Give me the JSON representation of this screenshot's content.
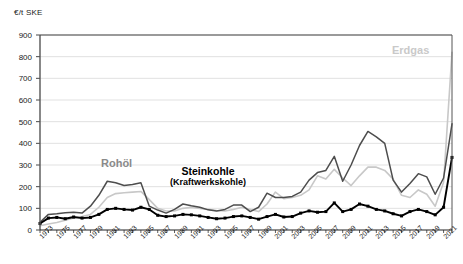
{
  "axis": {
    "unit_label": "€/t SKE",
    "y_ticks": [
      0,
      100,
      200,
      300,
      400,
      500,
      600,
      700,
      800,
      900
    ],
    "ylim": [
      0,
      900
    ],
    "x_ticks": [
      "1973",
      "1975",
      "1977",
      "1979",
      "1981",
      "1983",
      "1985",
      "1987",
      "1989",
      "1991",
      "1993",
      "1995",
      "1997",
      "1999",
      "2001",
      "2003",
      "2005",
      "2007",
      "2009",
      "2011",
      "2013",
      "2015",
      "2017",
      "2019",
      "2021"
    ]
  },
  "labels": {
    "rohoel": "Rohöl",
    "erdgas": "Erdgas",
    "steinkohle_main": "Steinkohle",
    "steinkohle_sub": "(Kraftwerkskohle)"
  },
  "colors": {
    "rohoel": "#4d4d4d",
    "erdgas": "#c8c8c8",
    "steinkohle": "#000000",
    "grid": "#d9d9d9",
    "axis": "#333333"
  },
  "chart_data": {
    "type": "line",
    "title": "",
    "xlabel": "",
    "ylabel": "€/t SKE",
    "ylim": [
      0,
      900
    ],
    "grid": true,
    "legend": "inline-annotations",
    "x": [
      1973,
      1974,
      1975,
      1976,
      1977,
      1978,
      1979,
      1980,
      1981,
      1982,
      1983,
      1984,
      1985,
      1986,
      1987,
      1988,
      1989,
      1990,
      1991,
      1992,
      1993,
      1994,
      1995,
      1996,
      1997,
      1998,
      1999,
      2000,
      2001,
      2002,
      2003,
      2004,
      2005,
      2006,
      2007,
      2008,
      2009,
      2010,
      2011,
      2012,
      2013,
      2014,
      2015,
      2016,
      2017,
      2018,
      2019,
      2020,
      2021,
      2022
    ],
    "series": [
      {
        "name": "Rohöl",
        "color": "#4d4d4d",
        "values": [
          35,
          72,
          75,
          80,
          82,
          78,
          110,
          160,
          225,
          218,
          205,
          210,
          218,
          110,
          92,
          78,
          95,
          120,
          112,
          105,
          93,
          88,
          95,
          115,
          115,
          85,
          105,
          170,
          150,
          150,
          155,
          175,
          230,
          265,
          275,
          340,
          225,
          300,
          390,
          455,
          430,
          400,
          230,
          175,
          215,
          260,
          245,
          165,
          240,
          490
        ]
      },
      {
        "name": "Erdgas",
        "color": "#c8c8c8",
        "values": [
          20,
          28,
          35,
          45,
          55,
          62,
          72,
          105,
          150,
          168,
          172,
          175,
          178,
          140,
          100,
          88,
          88,
          100,
          105,
          100,
          95,
          90,
          88,
          95,
          105,
          95,
          85,
          120,
          175,
          145,
          150,
          160,
          185,
          250,
          235,
          280,
          240,
          205,
          250,
          290,
          290,
          275,
          235,
          160,
          150,
          185,
          165,
          110,
          220,
          820
        ]
      },
      {
        "name": "Steinkohle (Kraftwerkskohle)",
        "color": "#000000",
        "values": [
          30,
          55,
          58,
          52,
          60,
          55,
          58,
          72,
          95,
          100,
          95,
          92,
          105,
          95,
          68,
          62,
          65,
          72,
          70,
          65,
          58,
          52,
          55,
          62,
          65,
          58,
          50,
          62,
          72,
          60,
          62,
          78,
          88,
          82,
          85,
          125,
          85,
          95,
          120,
          110,
          95,
          88,
          75,
          65,
          85,
          95,
          85,
          70,
          105,
          335
        ]
      }
    ]
  }
}
